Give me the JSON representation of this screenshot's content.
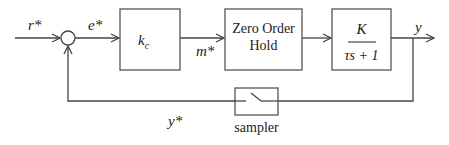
{
  "diagram": {
    "type": "sampled-data feedback control loop",
    "signals": {
      "reference": "r*",
      "error": "e*",
      "controller_output": "m*",
      "output": "y",
      "sampled_feedback": "y*"
    },
    "blocks": {
      "controller": {
        "label_main": "k",
        "label_sub": "c"
      },
      "hold": {
        "line1": "Zero Order",
        "line2": "Hold"
      },
      "plant": {
        "numerator": "K",
        "denominator": "τs + 1"
      },
      "sampler": {
        "label": "sampler"
      }
    },
    "colors": {
      "line": "#444444",
      "text": "#222222",
      "background": "#ffffff"
    }
  }
}
